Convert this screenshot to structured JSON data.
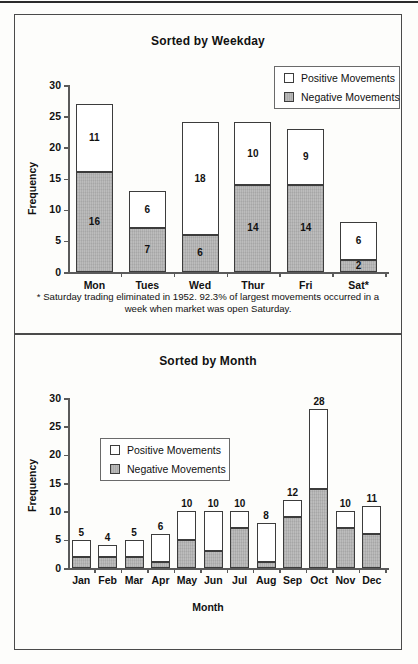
{
  "figure": {
    "footnote": "* Saturday trading eliminated in 1952.  92.3% of largest movements occurred in a week when market was open Saturday."
  },
  "legend": {
    "positive_label": "Positive Movements",
    "negative_label": "Negative Movements",
    "positive_swatch_name": "positive-movements-swatch",
    "negative_swatch_name": "negative-movements-swatch"
  },
  "colors": {
    "negative_fill": "#b6b6b6",
    "positive_fill": "#ffffff",
    "outline": "#3c3c3c",
    "axis": "#5a5a5a",
    "frame": "#4a4a4a"
  },
  "chart_data": [
    {
      "id": "weekday",
      "type": "bar",
      "stacked": true,
      "title": "Sorted by Weekday",
      "xlabel": "",
      "ylabel": "Frequency",
      "ylim": [
        0,
        30
      ],
      "yticks": [
        0,
        5,
        10,
        15,
        20,
        25,
        30
      ],
      "ytick_labels": [
        "0",
        "5",
        "10",
        "15",
        "20",
        "25",
        "30"
      ],
      "grid": false,
      "legend_position": "top-right",
      "categories": [
        "Mon",
        "Tues",
        "Wed",
        "Thur",
        "Fri",
        "Sat*"
      ],
      "series": [
        {
          "name": "Negative Movements",
          "values": [
            16,
            7,
            6,
            14,
            14,
            2
          ]
        },
        {
          "name": "Positive Movements",
          "values": [
            11,
            6,
            18,
            10,
            9,
            6
          ]
        }
      ],
      "totals": [
        27,
        13,
        24,
        24,
        23,
        8
      ],
      "value_labels": "inside-segments",
      "annotation": "* Saturday trading eliminated in 1952.  92.3% of largest movements occurred in a week when market was open Saturday."
    },
    {
      "id": "month",
      "type": "bar",
      "stacked": true,
      "title": "Sorted by Month",
      "xlabel": "Month",
      "ylabel": "Frequency",
      "ylim": [
        0,
        30
      ],
      "yticks": [
        0,
        5,
        10,
        15,
        20,
        25,
        30
      ],
      "ytick_labels": [
        "0",
        "5",
        "10",
        "15",
        "20",
        "25",
        "30"
      ],
      "grid": false,
      "legend_position": "upper-left-inside",
      "categories": [
        "Jan",
        "Feb",
        "Mar",
        "Apr",
        "May",
        "Jun",
        "Jul",
        "Aug",
        "Sep",
        "Oct",
        "Nov",
        "Dec"
      ],
      "series": [
        {
          "name": "Negative Movements",
          "values": [
            2,
            2,
            2,
            1,
            5,
            3,
            7,
            1,
            9,
            14,
            7,
            6
          ]
        },
        {
          "name": "Positive Movements",
          "values": [
            3,
            2,
            3,
            5,
            5,
            7,
            3,
            7,
            3,
            14,
            3,
            5
          ]
        }
      ],
      "totals": [
        5,
        4,
        5,
        6,
        10,
        10,
        10,
        8,
        12,
        28,
        10,
        11
      ],
      "total_labels": [
        "5",
        "4",
        "5",
        "6",
        "10",
        "10",
        "10",
        "8",
        "12",
        "28",
        "10",
        "11"
      ],
      "value_labels": "above-bar"
    }
  ]
}
